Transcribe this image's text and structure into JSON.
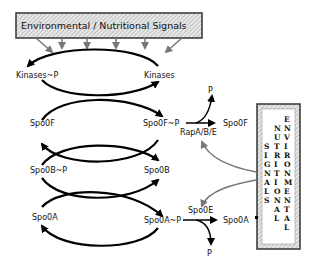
{
  "top_box": {
    "label": "Environmental  /  Nutritional  Signals"
  },
  "side_box": {
    "columns": [
      {
        "word": "SIGNALS",
        "letters": [
          "S",
          "I",
          "G",
          "N",
          "A",
          "L",
          "S"
        ]
      },
      {
        "word": "NUTRITIONAL",
        "letters": [
          "N",
          "U",
          "T",
          "R",
          "I",
          "T",
          "I",
          "O",
          "N",
          "A",
          "L"
        ]
      },
      {
        "word": "ENVIRONMENTAL",
        "letters": [
          "E",
          "N",
          "V",
          "I",
          "R",
          "O",
          "N",
          "M",
          "E",
          "N",
          "T",
          "A",
          "L"
        ]
      }
    ]
  },
  "nodes": {
    "kinases_p": "Kinases~P",
    "kinases": "Kinases",
    "spo0f": "Spo0F",
    "spo0f_p": "Spo0F~P",
    "spo0b_p": "Spo0B~P",
    "spo0b": "Spo0B",
    "spo0a": "Spo0A",
    "spo0a_p": "Spo0A~P"
  },
  "dephosphorylation": {
    "rap": {
      "enzyme": "RapA/B/E",
      "product": "Spo0F",
      "phosphate": "P"
    },
    "spo0e": {
      "enzyme": "Spo0E",
      "product": "Spo0A",
      "phosphate": "P"
    }
  },
  "colors": {
    "box_border": "#333333",
    "hatch": "#bbbbbb",
    "signal_arrows": "#777777",
    "curves": "#000000"
  }
}
